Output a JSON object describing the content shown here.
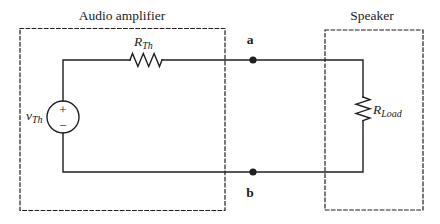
{
  "figure": {
    "bg": "#ffffff",
    "line": "#1f1f1f"
  },
  "blocks": {
    "amplifier_label": "Audio amplifier",
    "speaker_label": "Speaker"
  },
  "source": {
    "name": "v",
    "sub": "Th",
    "plus": "+",
    "minus": "−"
  },
  "resistor_th": {
    "name": "R",
    "sub": "Th"
  },
  "resistor_load": {
    "name": "R",
    "sub": "Load"
  },
  "terminals": {
    "a": "a",
    "b": "b"
  }
}
